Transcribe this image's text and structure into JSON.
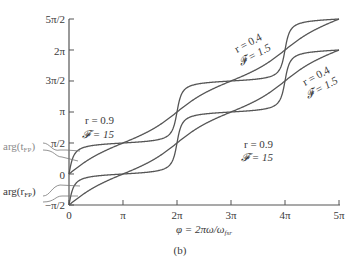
{
  "chart_data": {
    "type": "line",
    "title": "",
    "panel_label": "(b)",
    "xlabel": "φ = 2πω/ω_fsr",
    "ylabel": "",
    "x_ticks": [
      "0",
      "π",
      "2π",
      "3π",
      "4π",
      "5π"
    ],
    "x_tick_values": [
      0,
      3.14159,
      6.28319,
      9.42478,
      12.56637,
      15.70796
    ],
    "y_ticks": [
      "−π/2",
      "0",
      "π/2",
      "π",
      "3π/2",
      "2π",
      "5π/2"
    ],
    "y_tick_values": [
      -1.5708,
      0,
      1.5708,
      3.14159,
      4.71239,
      6.28319,
      7.85398
    ],
    "xlim": [
      0,
      15.70796
    ],
    "ylim": [
      -1.5708,
      7.85398
    ],
    "grid": false,
    "series": [
      {
        "name": "arg(t_FP), r = 0.9, F = 15",
        "quantity": "arg(t_FP)",
        "r": 0.9,
        "finesse": 15,
        "offset": 0,
        "start": 0,
        "end": 7.85398
      },
      {
        "name": "arg(t_FP), r = 0.4, F = 1.5",
        "quantity": "arg(t_FP)",
        "r": 0.4,
        "finesse": 1.5,
        "offset": 0,
        "start": 0,
        "end": 7.85398
      },
      {
        "name": "arg(r_FP), r = 0.9, F = 15",
        "quantity": "arg(r_FP)",
        "r": 0.9,
        "finesse": 15,
        "offset": -1.5708,
        "start": -1.5708,
        "end": 6.28319
      },
      {
        "name": "arg(r_FP), r = 0.4, F = 1.5",
        "quantity": "arg(r_FP)",
        "r": 0.4,
        "finesse": 1.5,
        "offset": -1.5708,
        "start": -1.5708,
        "end": 6.28319
      }
    ],
    "annotations": [
      {
        "text_line1": "r = 0.9",
        "text_line2": "𝓕 = 15",
        "position": "upper-left"
      },
      {
        "text_line1": "r = 0.4",
        "text_line2": "𝓕 = 1.5",
        "position": "upper-right (rotated)"
      },
      {
        "text_line1": "r = 0.4",
        "text_line2": "𝓕 = 1.5",
        "position": "right-middle (rotated)"
      },
      {
        "text_line1": "r = 0.9",
        "text_line2": "𝓕 = 15",
        "position": "lower-right"
      },
      {
        "text": "arg(t_FP)",
        "position": "left, pointing to upper curves at φ≈0"
      },
      {
        "text": "arg(r_FP)",
        "position": "left, pointing to lower curves at φ≈0"
      }
    ]
  },
  "labels": {
    "arg_t": "arg(t",
    "arg_t_sub": "FP",
    "arg_r": "arg(r",
    "arg_r_sub": "FP",
    "close_paren": ")",
    "x_axis_main": "φ = 2πω/ω",
    "x_axis_sub": "fsr",
    "panel": "(b)",
    "ann1_l1": "r = 0.9",
    "ann1_l2": "𝓕 = 15",
    "ann2_l1": "r = 0.4",
    "ann2_l2": "𝓕 = 1.5",
    "ann3_l1": "r = 0.4",
    "ann3_l2": "𝓕 = 1.5",
    "ann4_l1": "r = 0.9",
    "ann4_l2": "𝓕 = 15"
  }
}
